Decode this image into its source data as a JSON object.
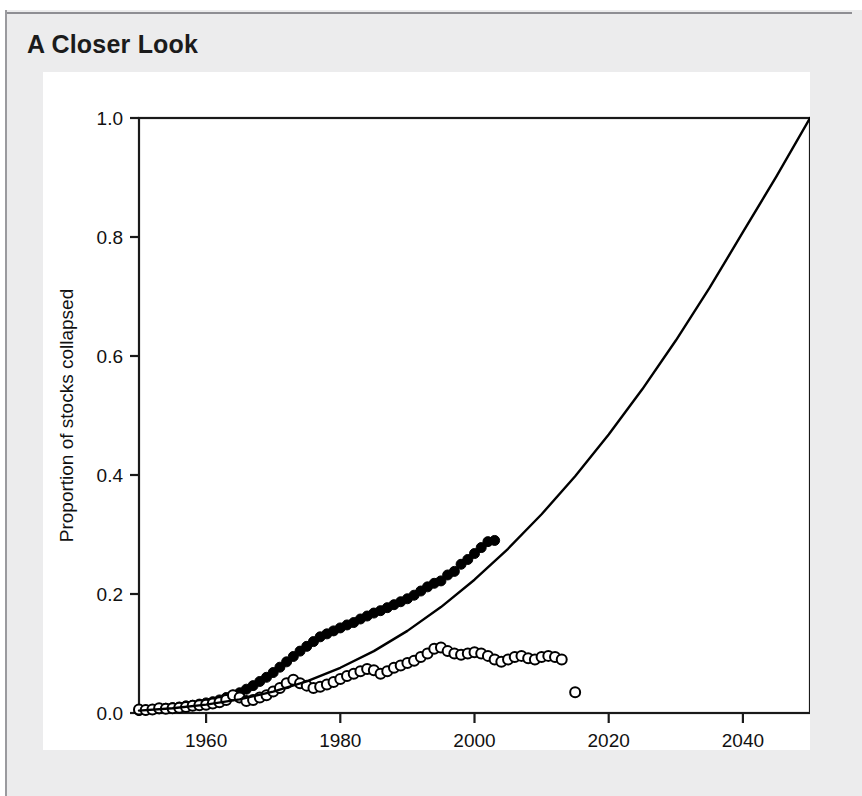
{
  "header": {
    "title": "A Closer Look"
  },
  "chart_data": {
    "type": "scatter",
    "title": "",
    "subtitle": "",
    "xlabel": "Year",
    "ylabel": "Proportion of stocks collapsed",
    "xlim": [
      1950,
      2050
    ],
    "ylim": [
      0.0,
      1.0
    ],
    "grid": false,
    "legend": "none",
    "x_ticks": [
      1960,
      1980,
      2000,
      2020,
      2040
    ],
    "x_tick_labels": [
      "1960",
      "1980",
      "2000",
      "2020",
      "2040"
    ],
    "y_ticks": [
      0.0,
      0.2,
      0.4,
      0.6,
      0.8,
      1.0
    ],
    "y_tick_labels": [
      "0.0",
      "0.2",
      "0.4",
      "0.6",
      "0.8",
      "1.0"
    ],
    "series": [
      {
        "name": "Cumulative collapsed stocks (filled circles)",
        "marker": "filled-circle",
        "color": "#000000",
        "x": [
          1950,
          1951,
          1952,
          1953,
          1954,
          1955,
          1956,
          1957,
          1958,
          1959,
          1960,
          1961,
          1962,
          1963,
          1964,
          1965,
          1966,
          1967,
          1968,
          1969,
          1970,
          1971,
          1972,
          1973,
          1974,
          1975,
          1976,
          1977,
          1978,
          1979,
          1980,
          1981,
          1982,
          1983,
          1984,
          1985,
          1986,
          1987,
          1988,
          1989,
          1990,
          1991,
          1992,
          1993,
          1994,
          1995,
          1996,
          1997,
          1998,
          1999,
          2000,
          2001,
          2002,
          2003
        ],
        "y": [
          0.004,
          0.005,
          0.006,
          0.007,
          0.008,
          0.009,
          0.01,
          0.012,
          0.013,
          0.015,
          0.017,
          0.019,
          0.022,
          0.026,
          0.03,
          0.034,
          0.04,
          0.046,
          0.053,
          0.06,
          0.068,
          0.077,
          0.086,
          0.095,
          0.104,
          0.112,
          0.12,
          0.128,
          0.133,
          0.138,
          0.143,
          0.148,
          0.152,
          0.158,
          0.163,
          0.168,
          0.172,
          0.177,
          0.182,
          0.187,
          0.192,
          0.198,
          0.205,
          0.212,
          0.218,
          0.222,
          0.232,
          0.238,
          0.25,
          0.258,
          0.268,
          0.278,
          0.288,
          0.29
        ]
      },
      {
        "name": "Currently collapsed stocks (open circles)",
        "marker": "open-circle",
        "color": "#000000",
        "x": [
          1950,
          1951,
          1952,
          1953,
          1954,
          1955,
          1956,
          1957,
          1958,
          1959,
          1960,
          1961,
          1962,
          1963,
          1964,
          1965,
          1966,
          1967,
          1968,
          1969,
          1970,
          1971,
          1972,
          1973,
          1974,
          1975,
          1976,
          1977,
          1978,
          1979,
          1980,
          1981,
          1982,
          1983,
          1984,
          1985,
          1986,
          1987,
          1988,
          1989,
          1990,
          1991,
          1992,
          1993,
          1994,
          1995,
          1996,
          1997,
          1998,
          1999,
          2000,
          2001,
          2002,
          2003,
          2004,
          2005,
          2006,
          2007,
          2008,
          2009,
          2010,
          2011,
          2012,
          2013,
          2015
        ],
        "y": [
          0.006,
          0.005,
          0.006,
          0.008,
          0.007,
          0.008,
          0.009,
          0.01,
          0.012,
          0.013,
          0.014,
          0.016,
          0.018,
          0.022,
          0.03,
          0.026,
          0.02,
          0.022,
          0.026,
          0.03,
          0.036,
          0.042,
          0.05,
          0.056,
          0.05,
          0.046,
          0.042,
          0.044,
          0.048,
          0.052,
          0.057,
          0.062,
          0.066,
          0.07,
          0.074,
          0.072,
          0.066,
          0.07,
          0.076,
          0.08,
          0.084,
          0.088,
          0.094,
          0.1,
          0.108,
          0.11,
          0.104,
          0.1,
          0.098,
          0.1,
          0.102,
          0.1,
          0.096,
          0.09,
          0.086,
          0.09,
          0.094,
          0.096,
          0.092,
          0.09,
          0.094,
          0.096,
          0.094,
          0.09,
          0.035
        ]
      },
      {
        "name": "Fitted projection curve",
        "marker": "line",
        "color": "#000000",
        "x": [
          1950,
          1955,
          1960,
          1965,
          1970,
          1975,
          1980,
          1985,
          1990,
          1995,
          2000,
          2005,
          2010,
          2015,
          2020,
          2025,
          2030,
          2035,
          2040,
          2045,
          2050
        ],
        "y": [
          0.004,
          0.008,
          0.014,
          0.023,
          0.036,
          0.053,
          0.076,
          0.104,
          0.138,
          0.178,
          0.224,
          0.276,
          0.334,
          0.398,
          0.468,
          0.544,
          0.626,
          0.714,
          0.808,
          0.902,
          1.0
        ]
      }
    ]
  }
}
